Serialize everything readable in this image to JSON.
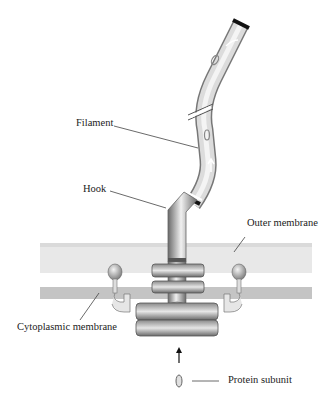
{
  "diagram": {
    "labels": {
      "filament": "Filament",
      "hook": "Hook",
      "outer_membrane": "Outer membrane",
      "cytoplasmic_membrane": "Cytoplasmic membrane",
      "protein_subunit": "Protein subunit"
    },
    "colors": {
      "membrane_outer": "#e6e6e6",
      "membrane_inner": "#c4c4c4",
      "structure_dark": "#6e6e6e",
      "structure_light": "#e8e8e8",
      "line": "#444444"
    }
  }
}
